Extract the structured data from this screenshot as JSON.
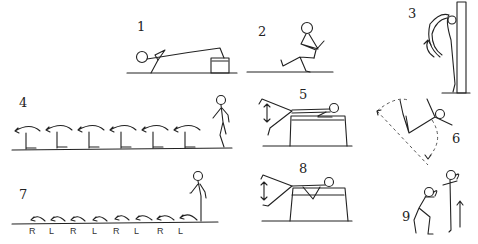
{
  "figures": [
    {
      "id": 1,
      "label": "1",
      "description": "lying on back, feet on box"
    },
    {
      "id": 2,
      "label": "2",
      "description": "seated leg raise"
    },
    {
      "id": 3,
      "label": "3",
      "description": "back arch against wall bars"
    },
    {
      "id": 4,
      "label": "4",
      "description": "hop over hurdles"
    },
    {
      "id": 5,
      "label": "5",
      "description": "prone leg raise on box"
    },
    {
      "id": 6,
      "label": "6",
      "description": "leg swing arc"
    },
    {
      "id": 7,
      "label": "7",
      "description": "alternating bounding steps",
      "steps": [
        "R",
        "L",
        "R",
        "L",
        "R",
        "L",
        "R",
        "L"
      ]
    },
    {
      "id": 8,
      "label": "8",
      "description": "prone leg raise on box, alternate"
    },
    {
      "id": 9,
      "label": "9",
      "description": "squat jump"
    }
  ],
  "colors": {
    "ink": "#222222",
    "background": "#ffffff"
  }
}
